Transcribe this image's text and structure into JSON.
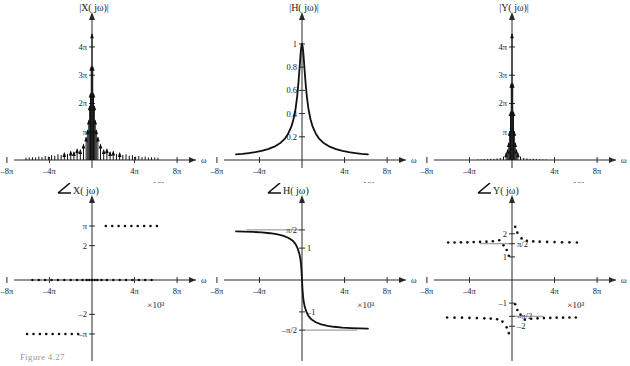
{
  "figure": {
    "caption": "Figure  4.27",
    "exponent_label": "×10³",
    "omega_label": "ω"
  },
  "panels": [
    {
      "id": "mag-x",
      "title": "|X( jω)|",
      "xlabel": "ω",
      "ylabel": "",
      "xticklabels": [
        "–8π",
        "–4π",
        "4π",
        "8π"
      ],
      "yticklabels": [
        "π",
        "2π",
        "3π",
        "4π"
      ]
    },
    {
      "id": "mag-h",
      "title": "|H( jω)|",
      "xlabel": "ω",
      "ylabel": "",
      "xticklabels": [
        "–8π",
        "–4π",
        "4π",
        "8π"
      ],
      "yticklabels": [
        "0.2",
        "0.4",
        "0.6",
        "0.8",
        "1"
      ]
    },
    {
      "id": "mag-y",
      "title": "|Y( jω)|",
      "xlabel": "ω",
      "ylabel": "",
      "xticklabels": [
        "–8π",
        "–4π",
        "4π",
        "8π"
      ],
      "yticklabels": [
        "π",
        "2π",
        "3π",
        "4π"
      ]
    },
    {
      "id": "phase-x",
      "title": "X( jω)",
      "title_prefix_icon": "angle-icon",
      "xlabel": "ω",
      "ylabel": "",
      "xticklabels": [
        "–8π",
        "–4π",
        "4π",
        "8π"
      ],
      "yticklabels": [
        "π",
        "2",
        "–2",
        "–π"
      ]
    },
    {
      "id": "phase-h",
      "title": "H( jω)",
      "title_prefix_icon": "angle-icon",
      "xlabel": "ω",
      "ylabel": "",
      "xticklabels": [
        "–8π",
        "–4π",
        "4π",
        "8π"
      ],
      "yticklabels": [
        "π/2",
        "1",
        "–1",
        "–π/2"
      ]
    },
    {
      "id": "phase-y",
      "title": "Y( jω)",
      "title_prefix_icon": "angle-icon",
      "xlabel": "ω",
      "ylabel": "",
      "xticklabels": [
        "–8π",
        "–4π",
        "4π",
        "8π"
      ],
      "yticklabels": [
        "2",
        "π/2",
        "1",
        "–1",
        "–π/2",
        "–2"
      ]
    }
  ],
  "chart_data": [
    {
      "type": "bar",
      "id": "mag-x",
      "title": "|X( jω)|",
      "xlabel": "ω",
      "ylabel": "|X( jω)|",
      "xlim": [
        -9.4,
        9.4
      ],
      "ylim": [
        0,
        4.6
      ],
      "xunit": "×10³ rad/s",
      "xtickvals": [
        -8,
        -4,
        4,
        8
      ],
      "xticklabels": [
        "–8π",
        "–4π",
        "4π",
        "8π"
      ],
      "ytickvals": [
        1,
        2,
        3,
        4
      ],
      "yticklabels": [
        "π",
        "2π",
        "3π",
        "4π"
      ],
      "grid": false,
      "comment": "Line spectrum: impulses at harmonics of fundamental, sinc-like envelope, tall cluster of dense lines near omega=0 reaching beyond 4pi",
      "x": [
        -6.2,
        -5.9,
        -5.6,
        -5.3,
        -5.0,
        -4.7,
        -4.4,
        -4.1,
        -3.8,
        -3.5,
        -3.2,
        -2.9,
        -2.6,
        -2.3,
        -2.0,
        -1.7,
        -1.4,
        -1.1,
        -0.8,
        -0.55,
        -0.4,
        -0.3,
        -0.22,
        -0.14,
        -0.07,
        0,
        0.07,
        0.14,
        0.22,
        0.3,
        0.4,
        0.55,
        0.8,
        1.1,
        1.4,
        1.7,
        2.0,
        2.3,
        2.6,
        2.9,
        3.2,
        3.5,
        3.8,
        4.1,
        4.4,
        4.7,
        5.0,
        5.3,
        5.6,
        5.9,
        6.2
      ],
      "values": [
        0.08,
        0.09,
        0.1,
        0.09,
        0.12,
        0.1,
        0.14,
        0.12,
        0.17,
        0.15,
        0.2,
        0.18,
        0.25,
        0.22,
        0.3,
        0.28,
        0.38,
        0.35,
        0.55,
        0.8,
        1.05,
        1.4,
        1.9,
        2.35,
        3.3,
        4.45,
        3.3,
        2.35,
        1.9,
        1.4,
        1.05,
        0.8,
        0.55,
        0.35,
        0.38,
        0.28,
        0.3,
        0.22,
        0.25,
        0.18,
        0.2,
        0.15,
        0.17,
        0.12,
        0.14,
        0.1,
        0.12,
        0.09,
        0.1,
        0.09,
        0.08
      ]
    },
    {
      "type": "line",
      "id": "mag-h",
      "title": "|H( jω)|",
      "xlabel": "ω",
      "ylabel": "|H( jω)|",
      "xlim": [
        -9.4,
        9.4
      ],
      "ylim": [
        0,
        1.12
      ],
      "xunit": "×10³ rad/s",
      "xtickvals": [
        -8,
        -4,
        4,
        8
      ],
      "xticklabels": [
        "–8π",
        "–4π",
        "4π",
        "8π"
      ],
      "ytickvals": [
        0.2,
        0.4,
        0.6,
        0.8,
        1.0
      ],
      "yticklabels": [
        "0.2",
        "0.4",
        "0.6",
        "0.8",
        "1"
      ],
      "grid": false,
      "comment": "Lowpass magnitude 1/sqrt(1+(w/wc)^2), narrow cutoff, peak value 1 at omega=0, curve drawn from -6.2 to 6.2",
      "x": [
        -6.2,
        -5.6,
        -5.0,
        -4.4,
        -3.8,
        -3.2,
        -2.6,
        -2.0,
        -1.6,
        -1.3,
        -1.0,
        -0.8,
        -0.6,
        -0.45,
        -0.35,
        -0.25,
        -0.18,
        -0.12,
        -0.06,
        0,
        0.06,
        0.12,
        0.18,
        0.25,
        0.35,
        0.45,
        0.6,
        0.8,
        1.0,
        1.3,
        1.6,
        2.0,
        2.6,
        3.2,
        3.8,
        4.4,
        5.0,
        5.6,
        6.2
      ],
      "values": [
        0.048,
        0.053,
        0.06,
        0.068,
        0.079,
        0.094,
        0.115,
        0.149,
        0.185,
        0.227,
        0.287,
        0.351,
        0.444,
        0.551,
        0.649,
        0.767,
        0.856,
        0.928,
        0.98,
        1.0,
        0.98,
        0.928,
        0.856,
        0.767,
        0.649,
        0.551,
        0.444,
        0.351,
        0.287,
        0.227,
        0.185,
        0.149,
        0.115,
        0.094,
        0.079,
        0.068,
        0.06,
        0.053,
        0.048
      ]
    },
    {
      "type": "bar",
      "id": "mag-y",
      "title": "|Y( jω)|",
      "xlabel": "ω",
      "ylabel": "|Y( jω)|",
      "xlim": [
        -9.4,
        9.4
      ],
      "ylim": [
        0,
        4.6
      ],
      "xunit": "×10³ rad/s",
      "xtickvals": [
        -8,
        -4,
        4,
        8
      ],
      "xticklabels": [
        "–8π",
        "–4π",
        "4π",
        "8π"
      ],
      "ytickvals": [
        1,
        2,
        3,
        4
      ],
      "yticklabels": [
        "π",
        "2π",
        "3π",
        "4π"
      ],
      "grid": false,
      "comment": "Product of X and H line spectra: outer lines strongly attenuated, only central cluster survives up to beyond 4pi",
      "x": [
        -3.2,
        -2.9,
        -2.6,
        -2.3,
        -2.0,
        -1.7,
        -1.4,
        -1.1,
        -0.8,
        -0.55,
        -0.4,
        -0.3,
        -0.22,
        -0.14,
        -0.07,
        0,
        0.07,
        0.14,
        0.22,
        0.3,
        0.4,
        0.55,
        0.8,
        1.1,
        1.4,
        1.7,
        2.0,
        2.3,
        2.6,
        2.9,
        3.2
      ],
      "values": [
        0.02,
        0.02,
        0.03,
        0.03,
        0.04,
        0.04,
        0.06,
        0.07,
        0.12,
        0.24,
        0.36,
        0.6,
        1.0,
        1.7,
        2.7,
        4.45,
        2.7,
        1.7,
        1.0,
        0.6,
        0.36,
        0.24,
        0.12,
        0.07,
        0.06,
        0.04,
        0.04,
        0.03,
        0.03,
        0.02,
        0.02
      ]
    },
    {
      "type": "scatter",
      "id": "phase-x",
      "title": "∠X( jω)",
      "xlabel": "ω",
      "ylabel": "∠X( jω)",
      "xlim": [
        -9.4,
        9.4
      ],
      "ylim": [
        -3.9,
        3.9
      ],
      "xunit": "×10³ rad/s",
      "xtickvals": [
        -8,
        -4,
        4,
        8
      ],
      "xticklabels": [
        "–8π",
        "–4π",
        "4π",
        "8π"
      ],
      "ytickvals": [
        -3.1416,
        -2,
        2,
        3.1416
      ],
      "yticklabels": [
        "–π",
        "–2",
        "2",
        "π"
      ],
      "grid": false,
      "comment": "Phase of X: +pi for a set of positive frequencies, 0 along the axis for the rest, -pi for a set of negative frequencies",
      "points_pi": [
        {
          "x": 1.3,
          "y": 3.1416
        },
        {
          "x": 1.9,
          "y": 3.1416
        },
        {
          "x": 2.5,
          "y": 3.1416
        },
        {
          "x": 3.1,
          "y": 3.1416
        },
        {
          "x": 3.7,
          "y": 3.1416
        },
        {
          "x": 4.3,
          "y": 3.1416
        },
        {
          "x": 4.9,
          "y": 3.1416
        },
        {
          "x": 5.5,
          "y": 3.1416
        },
        {
          "x": 6.1,
          "y": 3.1416
        }
      ],
      "points_zero": [
        {
          "x": -5.6,
          "y": 0
        },
        {
          "x": -5.0,
          "y": 0
        },
        {
          "x": -4.4,
          "y": 0
        },
        {
          "x": -3.8,
          "y": 0
        },
        {
          "x": -3.2,
          "y": 0
        },
        {
          "x": -2.6,
          "y": 0
        },
        {
          "x": -2.0,
          "y": 0
        },
        {
          "x": -1.4,
          "y": 0
        },
        {
          "x": -0.9,
          "y": 0
        },
        {
          "x": -0.5,
          "y": 0
        },
        {
          "x": -0.25,
          "y": 0
        },
        {
          "x": 0,
          "y": 0
        },
        {
          "x": 0.25,
          "y": 0
        },
        {
          "x": 0.5,
          "y": 0
        },
        {
          "x": 0.9,
          "y": 0
        },
        {
          "x": 1.4,
          "y": 0
        },
        {
          "x": 2.0,
          "y": 0
        },
        {
          "x": 2.6,
          "y": 0
        },
        {
          "x": 3.2,
          "y": 0
        },
        {
          "x": 3.8,
          "y": 0
        },
        {
          "x": 4.4,
          "y": 0
        },
        {
          "x": 5.0,
          "y": 0
        },
        {
          "x": 5.6,
          "y": 0
        }
      ],
      "points_negpi": [
        {
          "x": -6.1,
          "y": -3.1416
        },
        {
          "x": -5.5,
          "y": -3.1416
        },
        {
          "x": -4.9,
          "y": -3.1416
        },
        {
          "x": -4.3,
          "y": -3.1416
        },
        {
          "x": -3.7,
          "y": -3.1416
        },
        {
          "x": -3.1,
          "y": -3.1416
        },
        {
          "x": -2.5,
          "y": -3.1416
        },
        {
          "x": -1.9,
          "y": -3.1416
        },
        {
          "x": -1.3,
          "y": -3.1416
        }
      ]
    },
    {
      "type": "line",
      "id": "phase-h",
      "title": "∠H( jω)",
      "xlabel": "ω",
      "ylabel": "∠H( jω)",
      "xlim": [
        -9.4,
        9.4
      ],
      "ylim": [
        -2.1,
        2.1
      ],
      "xunit": "×10³ rad/s",
      "xtickvals": [
        -8,
        -4,
        4,
        8
      ],
      "xticklabels": [
        "–8π",
        "–4π",
        "4π",
        "8π"
      ],
      "ytickvals": [
        1.5708,
        1,
        -1,
        -1.5708
      ],
      "yticklabels": [
        "π/2",
        "1",
        "–1",
        "–π/2"
      ],
      "grid": false,
      "comment": "Phase of lowpass: -arctan(w/wc); approaches +pi/2 for negative omega and -pi/2 for positive omega, steep transition at origin",
      "x": [
        -6.2,
        -5.4,
        -4.6,
        -3.8,
        -3.0,
        -2.4,
        -1.8,
        -1.3,
        -0.9,
        -0.6,
        -0.4,
        -0.26,
        -0.17,
        -0.1,
        -0.05,
        0,
        0.05,
        0.1,
        0.17,
        0.26,
        0.4,
        0.6,
        0.9,
        1.3,
        1.8,
        2.4,
        3.0,
        3.8,
        4.6,
        5.4,
        6.2
      ],
      "values": [
        1.523,
        1.516,
        1.506,
        1.491,
        1.466,
        1.436,
        1.39,
        1.325,
        1.24,
        1.124,
        0.983,
        0.841,
        0.698,
        0.521,
        0.296,
        0,
        -0.296,
        -0.521,
        -0.698,
        -0.841,
        -0.983,
        -1.124,
        -1.24,
        -1.325,
        -1.39,
        -1.436,
        -1.466,
        -1.491,
        -1.506,
        -1.516,
        -1.523
      ]
    },
    {
      "type": "scatter",
      "id": "phase-y",
      "title": "∠Y( jω)",
      "xlabel": "ω",
      "ylabel": "∠Y( jω)",
      "xlim": [
        -9.4,
        9.4
      ],
      "ylim": [
        -2.9,
        2.9
      ],
      "xunit": "×10³ rad/s",
      "xtickvals": [
        -8,
        -4,
        4,
        8
      ],
      "xticklabels": [
        "–8π",
        "–4π",
        "4π",
        "8π"
      ],
      "ytickvals": [
        2,
        1.5708,
        1,
        -1,
        -1.5708,
        -2
      ],
      "yticklabels": [
        "2",
        "π/2",
        "1",
        "–1",
        "–π/2",
        "–2"
      ],
      "grid": false,
      "comment": "Phase of Y = phase X + phase H: upper branch near +pi/2 to +2 for negative and positive omega, lower branch near -pi/2 to -2; points crowd toward the origin transition",
      "points_upper": [
        {
          "x": -6.0,
          "y": 1.62
        },
        {
          "x": -5.4,
          "y": 1.62
        },
        {
          "x": -4.8,
          "y": 1.63
        },
        {
          "x": -4.2,
          "y": 1.63
        },
        {
          "x": -3.6,
          "y": 1.64
        },
        {
          "x": -3.0,
          "y": 1.65
        },
        {
          "x": -2.4,
          "y": 1.66
        },
        {
          "x": -1.8,
          "y": 1.68
        },
        {
          "x": -1.2,
          "y": 1.72
        },
        {
          "x": -0.8,
          "y": 1.5
        },
        {
          "x": -0.5,
          "y": 1.3
        },
        {
          "x": -0.3,
          "y": 1.05
        },
        {
          "x": 0.3,
          "y": 2.3
        },
        {
          "x": 0.5,
          "y": 2.05
        },
        {
          "x": 0.9,
          "y": 1.8
        },
        {
          "x": 1.4,
          "y": 1.7
        },
        {
          "x": 2.0,
          "y": 1.67
        },
        {
          "x": 2.6,
          "y": 1.66
        },
        {
          "x": 3.3,
          "y": 1.65
        },
        {
          "x": 4.0,
          "y": 1.64
        },
        {
          "x": 4.7,
          "y": 1.63
        },
        {
          "x": 5.4,
          "y": 1.63
        },
        {
          "x": 6.1,
          "y": 1.62
        }
      ],
      "points_lower": [
        {
          "x": -6.1,
          "y": -1.62
        },
        {
          "x": -5.4,
          "y": -1.63
        },
        {
          "x": -4.7,
          "y": -1.63
        },
        {
          "x": -4.0,
          "y": -1.64
        },
        {
          "x": -3.3,
          "y": -1.65
        },
        {
          "x": -2.6,
          "y": -1.66
        },
        {
          "x": -2.0,
          "y": -1.67
        },
        {
          "x": -1.4,
          "y": -1.7
        },
        {
          "x": -0.9,
          "y": -1.8
        },
        {
          "x": -0.5,
          "y": -2.05
        },
        {
          "x": -0.3,
          "y": -2.3
        },
        {
          "x": 0.3,
          "y": -1.05
        },
        {
          "x": 0.5,
          "y": -1.3
        },
        {
          "x": 0.8,
          "y": -1.5
        },
        {
          "x": 1.2,
          "y": -1.72
        },
        {
          "x": 1.8,
          "y": -1.68
        },
        {
          "x": 2.4,
          "y": -1.66
        },
        {
          "x": 3.0,
          "y": -1.65
        },
        {
          "x": 3.6,
          "y": -1.64
        },
        {
          "x": 4.2,
          "y": -1.63
        },
        {
          "x": 4.8,
          "y": -1.63
        },
        {
          "x": 5.4,
          "y": -1.62
        },
        {
          "x": 6.0,
          "y": -1.62
        }
      ]
    }
  ]
}
